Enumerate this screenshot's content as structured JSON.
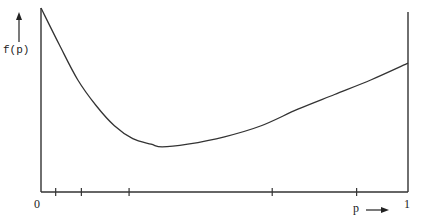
{
  "chart_data": {
    "type": "line",
    "title": "",
    "xlabel": "p",
    "ylabel": "f(p)",
    "xlim": [
      0,
      1
    ],
    "ylim": [
      0,
      1
    ],
    "x_tick_labels": [
      "0",
      "1"
    ],
    "x_minor_ticks": [
      0.04,
      0.11,
      0.24,
      0.63,
      0.86
    ],
    "grid": false,
    "legend": null,
    "series": [
      {
        "name": "f(p)",
        "x": [
          0,
          0.05,
          0.1,
          0.15,
          0.2,
          0.25,
          0.3,
          0.33,
          0.4,
          0.5,
          0.6,
          0.7,
          0.8,
          0.9,
          1.0
        ],
        "y": [
          1.0,
          0.8,
          0.61,
          0.47,
          0.36,
          0.29,
          0.26,
          0.245,
          0.26,
          0.3,
          0.36,
          0.45,
          0.53,
          0.61,
          0.7
        ]
      }
    ]
  },
  "labels": {
    "y_axis": "f(p)",
    "x_axis": "p",
    "x_origin": "0",
    "x_end": "1"
  },
  "colors": {
    "line": "#333333",
    "axis": "#333333",
    "background": "#ffffff"
  }
}
